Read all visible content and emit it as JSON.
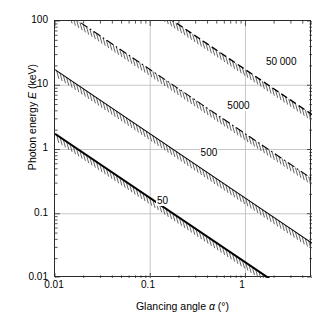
{
  "chart_data": {
    "type": "line",
    "title": "",
    "xlabel": "Glancing angle α (°)",
    "xlabel_parts": {
      "pre": "Glancing angle ",
      "symbol": "α",
      "post": " (°)"
    },
    "ylabel": "Photon energy E (keV)",
    "ylabel_parts": {
      "pre": "Photon energy ",
      "symbol": "E",
      "post": " (keV)"
    },
    "xscale": "log",
    "yscale": "log",
    "xlim": [
      0.01,
      5.0
    ],
    "ylim": [
      0.01,
      100
    ],
    "grid": true,
    "grid_color": "#b9b9b9",
    "minor_ticks": true,
    "legend": "none (inline curve labels)",
    "xticks": [
      0.01,
      0.1,
      1
    ],
    "xtick_labels": [
      "0.01",
      "0.1",
      "1"
    ],
    "yticks": [
      0.01,
      0.1,
      1,
      10,
      100
    ],
    "ytick_labels": [
      "0.01",
      "0.1",
      "1",
      "10",
      "100"
    ],
    "annotations": [
      {
        "text": "50",
        "x": 0.115,
        "y": 0.155
      },
      {
        "text": "500",
        "x": 0.33,
        "y": 0.84
      },
      {
        "text": "5000",
        "x": 0.63,
        "y": 4.6
      },
      {
        "text": "50 000",
        "x": 1.6,
        "y": 22.0
      }
    ],
    "series": [
      {
        "name": "50",
        "label": "50",
        "style": "solid",
        "width": 2.0,
        "color": "#000000",
        "hatched": true,
        "hatch_side": "below",
        "relation": "E = k / alpha",
        "k": 0.0175,
        "points": [
          [
            0.01,
            1.75
          ],
          [
            0.1,
            0.175
          ],
          [
            1.0,
            0.0175
          ],
          [
            1.75,
            0.01
          ]
        ]
      },
      {
        "name": "500",
        "label": "500",
        "style": "solid",
        "width": 1.1,
        "color": "#000000",
        "hatched": true,
        "hatch_side": "below",
        "relation": "E = k / alpha",
        "k": 0.175,
        "points": [
          [
            0.01,
            17.5
          ],
          [
            0.1,
            1.75
          ],
          [
            1.0,
            0.175
          ],
          [
            5.0,
            0.035
          ]
        ]
      },
      {
        "name": "5000",
        "label": "5000",
        "style": "dashdot",
        "width": 1.1,
        "color": "#000000",
        "hatched": true,
        "hatch_side": "below",
        "relation": "E = k / alpha",
        "k": 1.75,
        "points": [
          [
            0.0175,
            100
          ],
          [
            0.1,
            17.5
          ],
          [
            1.0,
            1.75
          ],
          [
            5.0,
            0.35
          ]
        ]
      },
      {
        "name": "50 000",
        "label": "50 000",
        "style": "dashed",
        "width": 1.4,
        "color": "#000000",
        "hatched": true,
        "hatch_side": "below",
        "relation": "E = k / alpha",
        "k": 17.5,
        "points": [
          [
            0.175,
            100
          ],
          [
            1.0,
            17.5
          ],
          [
            5.0,
            3.5
          ]
        ]
      }
    ]
  },
  "axes": {
    "frame_color": "#2b2b2b",
    "background": "#ffffff"
  }
}
